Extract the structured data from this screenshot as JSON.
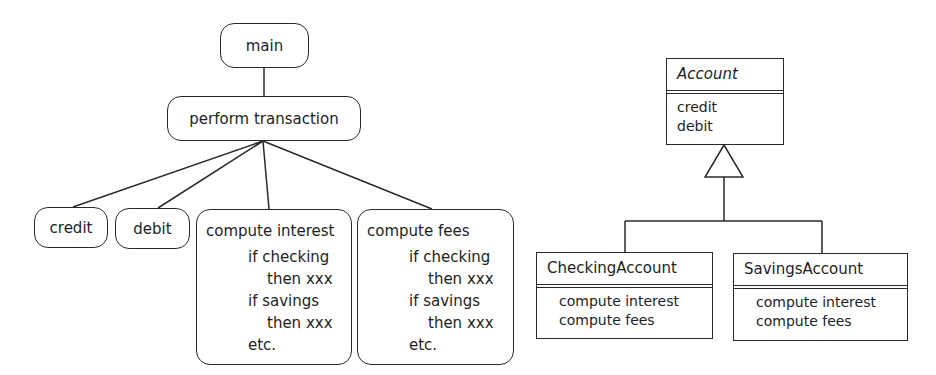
{
  "structured_diagram": {
    "root": "main",
    "mid": "perform transaction",
    "leaves": [
      {
        "label": "credit"
      },
      {
        "label": "debit"
      },
      {
        "label": "compute interest",
        "lines": [
          "if checking",
          "then xxx",
          "if savings",
          "then xxx",
          "etc."
        ]
      },
      {
        "label": "compute fees",
        "lines": [
          "if checking",
          "then xxx",
          "if savings",
          "then xxx",
          "etc."
        ]
      }
    ]
  },
  "class_diagram": {
    "base": {
      "name": "Account",
      "ops": [
        "credit",
        "debit"
      ]
    },
    "subclasses": [
      {
        "name": "CheckingAccount",
        "ops": [
          "compute interest",
          "compute fees"
        ]
      },
      {
        "name": "SavingsAccount",
        "ops": [
          "compute interest",
          "compute fees"
        ]
      }
    ]
  },
  "colors": {
    "stroke": "#2a2a2a",
    "background": "#ffffff"
  }
}
